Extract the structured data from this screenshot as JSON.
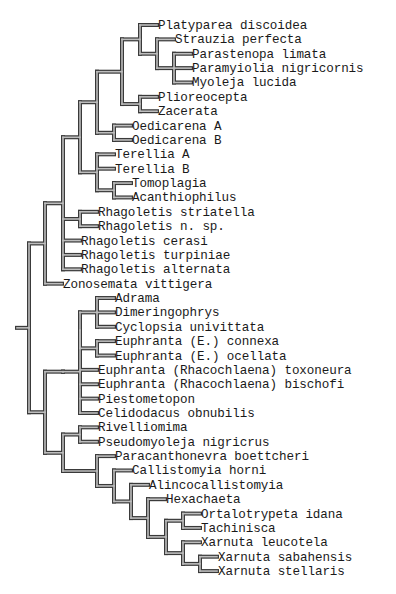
{
  "diagram": {
    "type": "cladogram",
    "row_start_y": 25,
    "row_spacing": 14.37,
    "root_stub_x": 17,
    "colors": {
      "line_outer": "#3a3a3a",
      "line_inner": "#bdbdbd",
      "text": "#1a1a1a",
      "background": "#ffffff"
    },
    "tree": {
      "x": 29,
      "children": [
        {
          "x": 45,
          "children": [
            {
              "x": 63,
              "children": [
                {
                  "x": 80,
                  "children": [
                    {
                      "x": 97,
                      "children": [
                        {
                          "x": 122,
                          "children": [
                            {
                              "x": 140,
                              "children": [
                                {
                                  "label": "Platyparea discoidea"
                                },
                                {
                                  "x": 157,
                                  "children": [
                                    {
                                      "label": "Strauzia perfecta"
                                    },
                                    {
                                      "x": 174,
                                      "children": [
                                        {
                                          "label": "Parastenopa limata"
                                        },
                                        {
                                          "label": "Paramyiolia nigricornis"
                                        },
                                        {
                                          "label": "Myoleja lucida"
                                        }
                                      ]
                                    }
                                  ]
                                }
                              ]
                            },
                            {
                              "x": 140,
                              "children": [
                                {
                                  "label": "Plioreocepta"
                                },
                                {
                                  "label": "Zacerata"
                                }
                              ]
                            }
                          ]
                        },
                        {
                          "x": 114,
                          "children": [
                            {
                              "label": "Oedicarena A"
                            },
                            {
                              "label": "Oedicarena B"
                            }
                          ]
                        }
                      ]
                    },
                    {
                      "x": 97,
                      "children": [
                        {
                          "label": "Terellia A"
                        },
                        {
                          "label": "Terellia B"
                        },
                        {
                          "x": 114,
                          "children": [
                            {
                              "label": "Tomoplagia"
                            },
                            {
                              "label": "Acanthiophilus"
                            }
                          ]
                        }
                      ]
                    }
                  ]
                },
                {
                  "x": 80,
                  "children": [
                    {
                      "label": "Rhagoletis striatella"
                    },
                    {
                      "label": "Rhagoletis n. sp."
                    }
                  ]
                },
                {
                  "label": "Rhagoletis cerasi"
                },
                {
                  "label": "Rhagoletis turpiniae"
                },
                {
                  "label": "Rhagoletis alternata"
                }
              ]
            },
            {
              "label": "Zonosemata vittigera"
            }
          ]
        },
        {
          "x": 45,
          "children": [
            {
              "x": 63,
              "children": [
                {
                  "x": 80,
                  "children": [
                    {
                      "x": 80,
                      "children": [
                        {
                          "x": 97,
                          "children": [
                            {
                              "label": "Adrama"
                            },
                            {
                              "label": "Dimeringophrys"
                            },
                            {
                              "label": "Cyclopsia univittata"
                            }
                          ]
                        },
                        {
                          "x": 97,
                          "children": [
                            {
                              "label": "Euphranta (E.) connexa"
                            },
                            {
                              "label": "Euphranta (E.) ocellata"
                            }
                          ]
                        }
                      ]
                    },
                    {
                      "label": "Euphranta (Rhacochlaena) toxoneura"
                    },
                    {
                      "label": "Euphranta (Rhacochlaena) bischofi"
                    },
                    {
                      "label": "Piestometopon"
                    },
                    {
                      "label": "Celidodacus obnubilis"
                    }
                  ]
                }
              ]
            },
            {
              "x": 63,
              "children": [
                {
                  "x": 80,
                  "children": [
                    {
                      "label": "Rivelliomima"
                    },
                    {
                      "label": "Pseudomyoleja nigricrus"
                    }
                  ]
                },
                {
                  "x": 97,
                  "children": [
                    {
                      "label": "Paracanthonevra boettcheri"
                    },
                    {
                      "x": 114,
                      "children": [
                        {
                          "label": "Callistomyia horni"
                        },
                        {
                          "x": 131,
                          "children": [
                            {
                              "label": "Alincocallistomyia"
                            },
                            {
                              "x": 148,
                              "children": [
                                {
                                  "label": "Hexachaeta"
                                },
                                {
                                  "x": 166,
                                  "children": [
                                    {
                                      "x": 183,
                                      "children": [
                                        {
                                          "label": "Ortalotrypeta idana"
                                        },
                                        {
                                          "label": "Tachinisca"
                                        }
                                      ]
                                    },
                                    {
                                      "x": 183,
                                      "children": [
                                        {
                                          "label": "Xarnuta leucotela"
                                        },
                                        {
                                          "x": 200,
                                          "children": [
                                            {
                                              "label": "Xarnuta sabahensis"
                                            },
                                            {
                                              "label": "Xarnuta stellaris"
                                            }
                                          ]
                                        }
                                      ]
                                    }
                                  ]
                                }
                              ]
                            }
                          ]
                        }
                      ]
                    }
                  ]
                }
              ]
            }
          ]
        }
      ]
    },
    "taxa": [
      "Platyparea discoidea",
      "Strauzia perfecta",
      "Parastenopa limata",
      "Paramyiolia nigricornis",
      "Myoleja lucida",
      "Plioreocepta",
      "Zacerata",
      "Oedicarena A",
      "Oedicarena B",
      "Terellia A",
      "Terellia B",
      "Tomoplagia",
      "Acanthiophilus",
      "Rhagoletis striatella",
      "Rhagoletis n. sp.",
      "Rhagoletis cerasi",
      "Rhagoletis turpiniae",
      "Rhagoletis alternata",
      "Zonosemata vittigera",
      "Adrama",
      "Dimeringophrys",
      "Cyclopsia univittata",
      "Euphranta (E.) connexa",
      "Euphranta (E.) ocellata",
      "Euphranta (Rhacochlaena) toxoneura",
      "Euphranta (Rhacochlaena) bischofi",
      "Piestometopon",
      "Celidodacus obnubilis",
      "Rivelliomima",
      "Pseudomyoleja nigricrus",
      "Paracanthonevra boettcheri",
      "Callistomyia horni",
      "Alincocallistomyia",
      "Hexachaeta",
      "Ortalotrypeta idana",
      "Tachinisca",
      "Xarnuta leucotela",
      "Xarnuta sabahensis",
      "Xarnuta stellaris"
    ]
  }
}
